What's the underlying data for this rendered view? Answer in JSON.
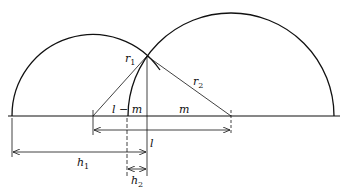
{
  "figure": {
    "colors": {
      "stroke": "#111111",
      "background": "#ffffff"
    },
    "labels": {
      "r1": {
        "base": "r",
        "sub": "1"
      },
      "r2": {
        "base": "r",
        "sub": "2"
      },
      "l_minus_m": "l − m",
      "m": "m",
      "l": "l",
      "h1": {
        "base": "h",
        "sub": "1"
      },
      "h2": {
        "base": "h",
        "sub": "2"
      }
    }
  }
}
